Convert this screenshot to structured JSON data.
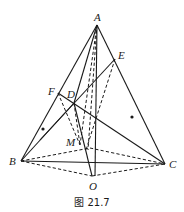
{
  "figure": {
    "caption": "图 21.7",
    "points": {
      "A": "A",
      "B": "B",
      "C": "C",
      "D": "D",
      "E": "E",
      "F": "F",
      "M": "M",
      "O": "O"
    },
    "solid_segments": [
      [
        "A",
        "B"
      ],
      [
        "A",
        "C"
      ],
      [
        "B",
        "C"
      ],
      [
        "A",
        "F"
      ],
      [
        "A",
        "D"
      ],
      [
        "A",
        "O"
      ],
      [
        "F",
        "C"
      ],
      [
        "E",
        "D"
      ],
      [
        "D",
        "O"
      ],
      [
        "B",
        "D"
      ]
    ],
    "dashed_segments": [
      [
        "A",
        "M"
      ],
      [
        "E",
        "M"
      ],
      [
        "F",
        "M"
      ],
      [
        "B",
        "M"
      ],
      [
        "M",
        "C"
      ],
      [
        "B",
        "O"
      ],
      [
        "O",
        "C"
      ],
      [
        "D",
        "M"
      ]
    ],
    "marked_dots": 2
  }
}
